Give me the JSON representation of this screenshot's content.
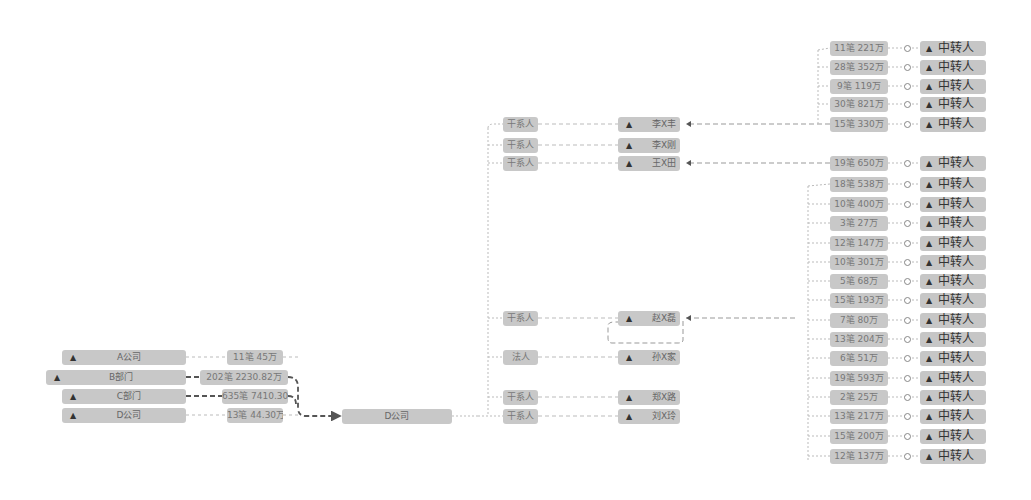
{
  "colors": {
    "node_bg": "#c8c8c8",
    "link_light": "#bbbbbb",
    "link_dark": "#555555",
    "text": "#666666"
  },
  "sources": [
    {
      "label": "A公司",
      "icon": "home-icon",
      "amount": "11笔 45万"
    },
    {
      "label": "B部门",
      "icon": "home-icon",
      "amount": "202笔 2230.82万"
    },
    {
      "label": "C部门",
      "icon": "home-icon",
      "amount": "635笔 7410.30万"
    },
    {
      "label": "D公司",
      "icon": "home-icon",
      "amount": "13笔 44.30万"
    }
  ],
  "center": {
    "label": "D公司"
  },
  "relations": [
    {
      "role": "干系人",
      "name": "李X丰",
      "icon": "person-icon"
    },
    {
      "role": "干系人",
      "name": "李X刚",
      "icon": "person-icon"
    },
    {
      "role": "干系人",
      "name": "王X田",
      "icon": "person-icon"
    },
    {
      "role": "干系人",
      "name": "赵X磊",
      "icon": "person-icon"
    },
    {
      "role": "法人",
      "name": "孙X家",
      "icon": "person-icon"
    },
    {
      "role": "干系人",
      "name": "郑X路",
      "icon": "person-icon"
    },
    {
      "role": "干系人",
      "name": "刘X玲",
      "icon": "person-icon"
    }
  ],
  "relay_label": "中转人",
  "transfers_group1": [
    {
      "amount": "11笔 221万"
    },
    {
      "amount": "28笔 352万"
    },
    {
      "amount": "9笔 119万"
    },
    {
      "amount": "30笔 821万"
    },
    {
      "amount": "15笔 330万"
    }
  ],
  "transfers_group2": [
    {
      "amount": "19笔 650万"
    }
  ],
  "transfers_group3": [
    {
      "amount": "18笔 538万"
    },
    {
      "amount": "10笔 400万"
    },
    {
      "amount": "3笔 27万"
    },
    {
      "amount": "12笔 147万"
    },
    {
      "amount": "10笔 301万"
    },
    {
      "amount": "5笔 68万"
    },
    {
      "amount": "15笔 193万"
    },
    {
      "amount": "7笔 80万"
    },
    {
      "amount": "13笔 204万"
    },
    {
      "amount": "6笔 51万"
    },
    {
      "amount": "19笔 593万"
    },
    {
      "amount": "2笔 25万"
    },
    {
      "amount": "13笔 217万"
    },
    {
      "amount": "15笔 200万"
    },
    {
      "amount": "12笔 137万"
    }
  ]
}
